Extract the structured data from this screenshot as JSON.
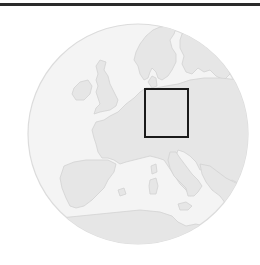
{
  "map": {
    "type": "locator-map",
    "region": "Europe",
    "highlighted_area": "Central Europe (Germany)",
    "colors": {
      "background": "#ffffff",
      "globe_fill": "#f4f4f4",
      "globe_stroke": "#dcdcdc",
      "land_fill": "#e6e6e6",
      "land_stroke": "#d2d2d2",
      "highlight_stroke": "#1a1a1a",
      "top_rule": "#2a2a2a"
    },
    "globe": {
      "cx": 138,
      "cy": 134,
      "r": 110
    },
    "highlight_box": {
      "x": 145,
      "y": 89,
      "width": 43,
      "height": 48
    }
  }
}
